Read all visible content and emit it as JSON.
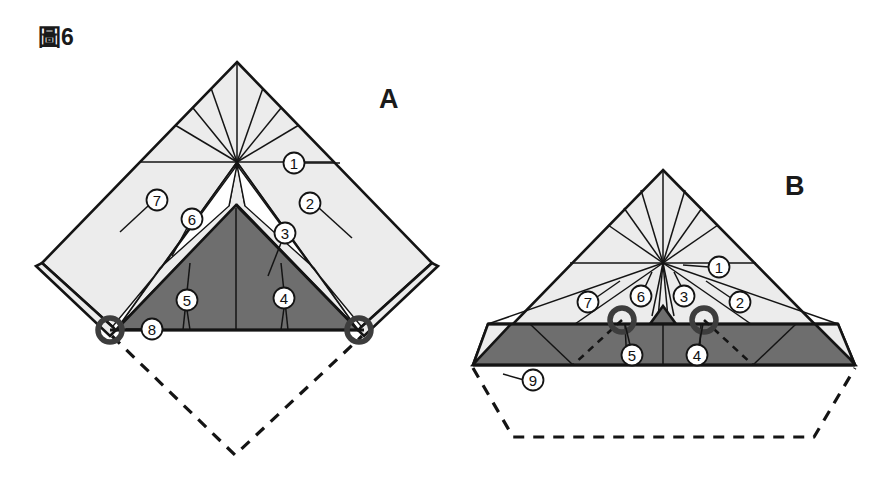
{
  "figure": {
    "label": "圖6",
    "panels": [
      {
        "id": "A",
        "letter": "A",
        "callouts": [
          {
            "num": "1",
            "cx": 294,
            "cy": 163,
            "lx1": 304,
            "ly1": 163,
            "lx2": 340,
            "ly2": 163
          },
          {
            "num": "2",
            "cx": 310,
            "cy": 203,
            "lx1": 319,
            "ly1": 208,
            "lx2": 352,
            "ly2": 238
          },
          {
            "num": "3",
            "cx": 285,
            "cy": 233,
            "lx1": 281,
            "ly1": 243,
            "lx2": 268,
            "ly2": 276
          },
          {
            "num": "4",
            "cx": 284,
            "cy": 298,
            "lx1": 284,
            "ly1": 308,
            "lx2": 281,
            "ly2": 330
          },
          {
            "num": "5",
            "cx": 187,
            "cy": 300,
            "lx1": 187,
            "ly1": 310,
            "lx2": 190,
            "ly2": 330
          },
          {
            "num": "6",
            "cx": 192,
            "cy": 219,
            "lx1": 187,
            "ly1": 228,
            "lx2": 172,
            "ly2": 256
          },
          {
            "num": "7",
            "cx": 157,
            "cy": 200,
            "lx1": 148,
            "ly1": 206,
            "lx2": 120,
            "ly2": 232
          },
          {
            "num": "8",
            "cx": 152,
            "cy": 329,
            "lx1": 143,
            "ly1": 329,
            "lx2": 124,
            "ly2": 329
          }
        ]
      },
      {
        "id": "B",
        "letter": "B",
        "callouts": [
          {
            "num": "1",
            "cx": 719,
            "cy": 267,
            "lx1": 709,
            "ly1": 267,
            "lx2": 683,
            "ly2": 267
          },
          {
            "num": "2",
            "cx": 740,
            "cy": 302,
            "lx1": 731,
            "ly1": 298,
            "lx2": 706,
            "ly2": 281
          },
          {
            "num": "3",
            "cx": 684,
            "cy": 296,
            "lx1": 681,
            "ly1": 286,
            "lx2": 674,
            "ly2": 272
          },
          {
            "num": "4",
            "cx": 697,
            "cy": 355,
            "lx1": 699,
            "ly1": 345,
            "lx2": 703,
            "ly2": 322
          },
          {
            "num": "5",
            "cx": 632,
            "cy": 355,
            "lx1": 630,
            "ly1": 345,
            "lx2": 625,
            "ly2": 322
          },
          {
            "num": "6",
            "cx": 641,
            "cy": 296,
            "lx1": 645,
            "ly1": 287,
            "lx2": 652,
            "ly2": 272
          },
          {
            "num": "7",
            "cx": 588,
            "cy": 302,
            "lx1": 597,
            "ly1": 297,
            "lx2": 620,
            "ly2": 281
          },
          {
            "num": "9",
            "cx": 533,
            "cy": 380,
            "lx1": 524,
            "ly1": 380,
            "lx2": 503,
            "ly2": 380
          }
        ]
      }
    ],
    "colors": {
      "light_region": "#ececec",
      "dark_region": "#6e6e6e",
      "outline": "#141414",
      "marker_ring": "#3d3d3d",
      "background": "#ffffff"
    }
  }
}
